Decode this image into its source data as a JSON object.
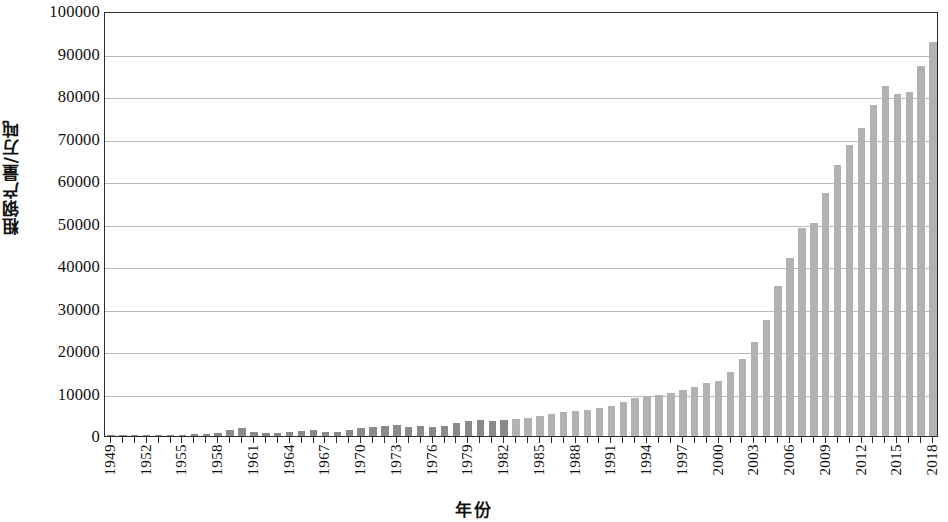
{
  "chart_data": {
    "type": "bar",
    "title": "",
    "xlabel": "年份",
    "ylabel": "粗钢产量/万吨",
    "ylim": [
      0,
      100000
    ],
    "ytick_step": 10000,
    "yticks": [
      0,
      10000,
      20000,
      30000,
      40000,
      50000,
      60000,
      70000,
      80000,
      90000,
      100000
    ],
    "ytick_labels": [
      "0",
      "10000",
      "20000",
      "30000",
      "40000",
      "50000",
      "60000",
      "70000",
      "80000",
      "90000",
      "100000"
    ],
    "xtick_labels": [
      "1949",
      "1952",
      "1955",
      "1958",
      "1961",
      "1964",
      "1967",
      "1970",
      "1973",
      "1976",
      "1979",
      "1982",
      "1985",
      "1988",
      "1991",
      "1994",
      "1997",
      "2000",
      "2003",
      "2006",
      "2009",
      "2012",
      "2015",
      "2018"
    ],
    "xtick_interval_years": 3,
    "grid": true,
    "legend": "none",
    "bar_color": "#9a9a9a",
    "axis_color": "#2b2b2b",
    "gridline_color": "#b9b9b9",
    "categories": [
      1949,
      1950,
      1951,
      1952,
      1953,
      1954,
      1955,
      1956,
      1957,
      1958,
      1959,
      1960,
      1961,
      1962,
      1963,
      1964,
      1965,
      1966,
      1967,
      1968,
      1969,
      1970,
      1971,
      1972,
      1973,
      1974,
      1975,
      1976,
      1977,
      1978,
      1979,
      1980,
      1981,
      1982,
      1983,
      1984,
      1985,
      1986,
      1987,
      1988,
      1989,
      1990,
      1991,
      1992,
      1993,
      1994,
      1995,
      1996,
      1997,
      1998,
      1999,
      2000,
      2001,
      2002,
      2003,
      2004,
      2005,
      2006,
      2007,
      2008,
      2009,
      2010,
      2011,
      2012,
      2013,
      2014,
      2015,
      2016,
      2017,
      2018
    ],
    "values": [
      16,
      61,
      90,
      135,
      177,
      223,
      285,
      447,
      535,
      800,
      1387,
      1866,
      870,
      667,
      762,
      964,
      1223,
      1532,
      1029,
      904,
      1333,
      1779,
      2132,
      2338,
      2522,
      2112,
      2390,
      2046,
      2374,
      3178,
      3448,
      3712,
      3560,
      3716,
      4002,
      4347,
      4679,
      5221,
      5628,
      5943,
      6159,
      6535,
      7100,
      8094,
      8956,
      9261,
      9536,
      10124,
      10894,
      11559,
      12426,
      12850,
      15163,
      18237,
      22234,
      27280,
      35324,
      41915,
      48929,
      50092,
      57218,
      63723,
      68528,
      72388,
      77904,
      82270,
      80383,
      80837,
      87091,
      92800
    ],
    "value_note": "粗钢产量 (万吨)"
  },
  "axes": {
    "y_title": "粗钢产量/万吨",
    "x_title": "年份"
  }
}
